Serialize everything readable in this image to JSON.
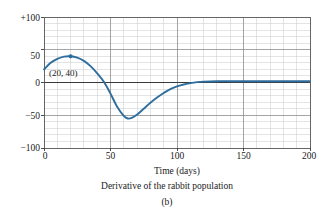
{
  "figure": {
    "panel_label": "(b)",
    "caption": "Derivative of the rabbit population"
  },
  "chart_data": {
    "type": "line",
    "title": "Derivative of the rabbit population",
    "xlabel": "Time (days)",
    "ylabel": "",
    "xlim": [
      0,
      200
    ],
    "ylim": [
      -100,
      100
    ],
    "grid": true,
    "legend": null,
    "x_ticks": [
      0,
      50,
      100,
      150,
      200
    ],
    "x_tick_labels": [
      "0",
      "50",
      "100",
      "150",
      "200"
    ],
    "y_ticks": [
      -100,
      -50,
      0,
      50,
      100
    ],
    "y_tick_labels": [
      "−100",
      "−50",
      "0",
      "50",
      "+100"
    ],
    "x_minor_step": 10,
    "y_minor_step": 10,
    "series": [
      {
        "name": "dP/dt",
        "color": "#2E6E9E",
        "x": [
          0,
          5,
          10,
          15,
          20,
          25,
          30,
          35,
          40,
          45,
          50,
          55,
          60,
          63,
          66,
          70,
          75,
          80,
          85,
          90,
          95,
          100,
          105,
          110,
          115,
          120,
          130,
          140,
          150,
          160,
          170,
          180,
          190,
          200
        ],
        "y": [
          20,
          30,
          36,
          39.5,
          40,
          38,
          33,
          25,
          14,
          1,
          -17,
          -37,
          -51,
          -55,
          -54,
          -49,
          -40,
          -31,
          -23,
          -16,
          -10,
          -6,
          -3,
          -1,
          0.5,
          1.3,
          2,
          2,
          2,
          2,
          2,
          2,
          2,
          2
        ]
      }
    ],
    "annotations": [
      {
        "text": "(20, 40)",
        "point_x": 20,
        "point_y": 40,
        "marker": true,
        "marker_color": "#2E6E9E"
      }
    ]
  }
}
